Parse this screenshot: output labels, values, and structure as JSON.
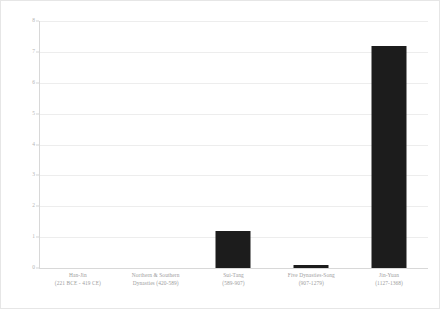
{
  "chart_data": {
    "type": "bar",
    "title": "",
    "subtitle": "",
    "xlabel": "",
    "ylabel": "",
    "ylim": [
      0,
      8
    ],
    "yticks": [
      "0",
      "1",
      "2",
      "3",
      "4",
      "5",
      "6",
      "7",
      "8"
    ],
    "grid": true,
    "legend": false,
    "bar_color": "#1c1c1c",
    "gridline_color": "#ededed",
    "axis_color": "#d8d8d8",
    "categories": [
      "Han-Jin (221 BCE - 419 CE)",
      "Northern & Southern Dynasties (420-589)",
      "Sui-Tang (589-907)",
      "Five Dynasties-Song (907-1279)",
      "Jin-Yuan (1127-1368)"
    ],
    "values": [
      0,
      0,
      1.2,
      0.1,
      7.2
    ],
    "bars": [
      {
        "name": "Han-Jin",
        "range": "(221 BCE - 419 CE)",
        "value": 0
      },
      {
        "name": "Northern & Southern",
        "range": "Dynasties (420-589)",
        "value": 0
      },
      {
        "name": "Sui-Tang",
        "range": "(589-907)",
        "value": 1.2
      },
      {
        "name": "Five Dynasties-Song",
        "range": "(907-1279)",
        "value": 0.1
      },
      {
        "name": "Jin-Yuan",
        "range": "(1127-1368)",
        "value": 7.2
      }
    ]
  }
}
